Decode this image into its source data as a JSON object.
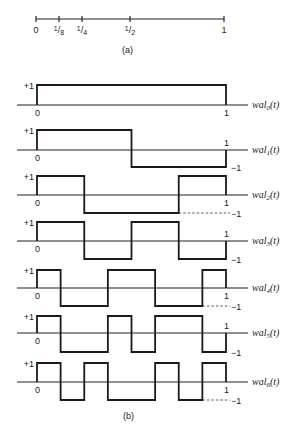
{
  "figure": {
    "part_a": {
      "caption": "(a)",
      "axis": {
        "y": 19,
        "x_start": 36,
        "x_end": 224
      },
      "ticks": [
        {
          "value": 0,
          "label": "0",
          "x": 36
        },
        {
          "value": 0.125,
          "label": "1/8",
          "x": 59
        },
        {
          "value": 0.25,
          "label": "1/4",
          "x": 82
        },
        {
          "value": 0.5,
          "label": "1/2",
          "x": 130
        },
        {
          "value": 1,
          "label": "1",
          "x": 224
        }
      ]
    },
    "part_b": {
      "caption": "(b)",
      "x0": 37,
      "x1": 226,
      "axis_x_start": 17,
      "axis_x_end": 248,
      "waveforms": [
        {
          "name": "wal",
          "index": "0",
          "label": "wal0(t)",
          "baseline": 105,
          "top": 85,
          "bottom": 105,
          "segments": [
            1,
            1,
            1,
            1,
            1,
            1,
            1,
            1
          ],
          "show_minus_one": false,
          "dashed_minus": false
        },
        {
          "name": "wal",
          "index": "1",
          "label": "wal1(t)",
          "baseline": 150,
          "top": 130,
          "bottom": 167,
          "segments": [
            1,
            1,
            1,
            1,
            -1,
            -1,
            -1,
            -1
          ],
          "show_minus_one": true,
          "dashed_minus": false
        },
        {
          "name": "wal",
          "index": "2",
          "label": "wal2(t)",
          "baseline": 195,
          "top": 176,
          "bottom": 213,
          "segments": [
            1,
            1,
            -1,
            -1,
            -1,
            -1,
            1,
            1
          ],
          "show_minus_one": true,
          "dashed_minus": true
        },
        {
          "name": "wal",
          "index": "3",
          "label": "wal3(t)",
          "baseline": 241,
          "top": 222,
          "bottom": 259,
          "segments": [
            1,
            1,
            -1,
            -1,
            1,
            1,
            -1,
            -1
          ],
          "show_minus_one": true,
          "dashed_minus": false
        },
        {
          "name": "wal",
          "index": "4",
          "label": "wal4(t)",
          "baseline": 288,
          "top": 270,
          "bottom": 306,
          "segments": [
            1,
            -1,
            -1,
            1,
            1,
            -1,
            -1,
            1
          ],
          "show_minus_one": true,
          "dashed_minus": true
        },
        {
          "name": "wal",
          "index": "5",
          "label": "wal5(t)",
          "baseline": 333,
          "top": 316,
          "bottom": 352,
          "segments": [
            1,
            -1,
            -1,
            1,
            -1,
            1,
            1,
            -1
          ],
          "show_minus_one": true,
          "dashed_minus": false
        },
        {
          "name": "wal",
          "index": "6",
          "label": "wal6(t)",
          "baseline": 382,
          "top": 363,
          "bottom": 400,
          "segments": [
            1,
            -1,
            1,
            -1,
            -1,
            1,
            -1,
            1
          ],
          "show_minus_one": true,
          "dashed_minus": true
        }
      ],
      "labels": {
        "plus_one": "+1",
        "minus_one": "−1",
        "zero": "0",
        "one": "1",
        "func_prefix": "wal",
        "func_suffix": "(t)"
      }
    }
  }
}
